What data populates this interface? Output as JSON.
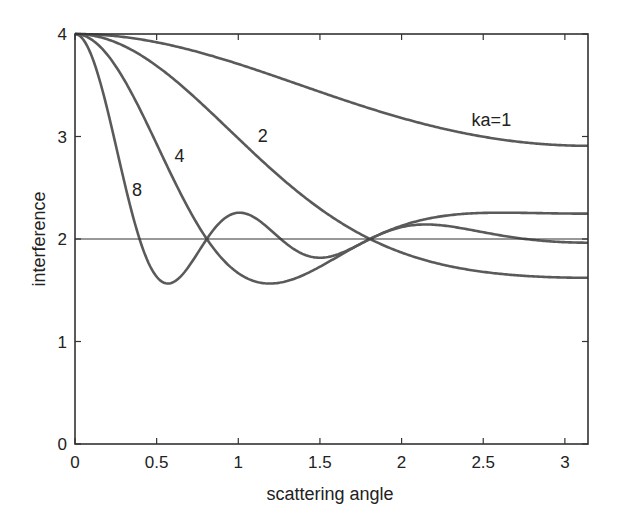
{
  "chart_data": {
    "type": "line",
    "title": "",
    "xlabel": "scattering angle",
    "ylabel": "interference",
    "xlim": [
      0,
      3.1416
    ],
    "ylim": [
      0,
      4
    ],
    "xticks": [
      0,
      0.5,
      1,
      1.5,
      2,
      2.5,
      3
    ],
    "xtick_labels": [
      "0",
      "0.5",
      "1",
      "1.5",
      "2",
      "2.5",
      "3"
    ],
    "yticks": [
      0,
      1,
      2,
      3,
      4
    ],
    "ytick_labels": [
      "0",
      "1",
      "2",
      "3",
      "4"
    ],
    "grid": false,
    "legend": "none (inline curve labels)",
    "reference_line": {
      "y": 2
    },
    "x": [
      0,
      0.1,
      0.2,
      0.3,
      0.4,
      0.5,
      0.6,
      0.7,
      0.8,
      0.9,
      1.0,
      1.1,
      1.2,
      1.3,
      1.4,
      1.5,
      1.6,
      1.7,
      1.8,
      1.9,
      2.0,
      2.1,
      2.2,
      2.3,
      2.4,
      2.5,
      2.6,
      2.7,
      2.8,
      2.9,
      3.0,
      3.1416
    ],
    "series": [
      {
        "name": "ka=1",
        "label": "ka=1",
        "ka": 1,
        "values": [
          4.0,
          4.0,
          3.99,
          3.97,
          3.95,
          3.92,
          3.88,
          3.84,
          3.79,
          3.75,
          3.71,
          3.65,
          3.6,
          3.55,
          3.49,
          3.44,
          3.39,
          3.33,
          3.28,
          3.23,
          3.18,
          3.14,
          3.1,
          3.06,
          3.02,
          3.0,
          2.97,
          2.95,
          2.93,
          2.92,
          2.91,
          2.91
        ]
      },
      {
        "name": "ka=2",
        "label": "2",
        "ka": 2,
        "values": [
          4.0,
          3.99,
          3.95,
          3.88,
          3.79,
          3.68,
          3.56,
          3.42,
          3.28,
          3.14,
          2.99,
          2.84,
          2.7,
          2.57,
          2.44,
          2.33,
          2.22,
          2.13,
          2.04,
          1.97,
          1.91,
          1.85,
          1.81,
          1.77,
          1.74,
          1.71,
          1.69,
          1.68,
          1.67,
          1.66,
          1.66,
          1.66
        ]
      },
      {
        "name": "ka=4",
        "label": "4",
        "ka": 4,
        "values": [
          4.0,
          3.95,
          3.79,
          3.56,
          3.28,
          2.99,
          2.7,
          2.44,
          2.22,
          2.04,
          1.91,
          1.82,
          1.77,
          1.76,
          1.77,
          1.81,
          1.86,
          1.92,
          1.98,
          2.04,
          2.09,
          2.13,
          2.16,
          2.18,
          2.2,
          2.21,
          2.21,
          2.21,
          2.21,
          2.21,
          2.21,
          2.21
        ]
      },
      {
        "name": "ka=8",
        "label": "8",
        "ka": 8,
        "values": [
          4.0,
          3.79,
          3.28,
          2.7,
          2.22,
          1.82,
          1.6,
          1.58,
          1.72,
          1.99,
          2.18,
          2.25,
          2.21,
          2.1,
          1.98,
          1.88,
          1.85,
          1.87,
          1.93,
          2.0,
          2.06,
          2.09,
          2.09,
          2.06,
          2.02,
          1.99,
          1.96,
          1.95,
          1.95,
          1.96,
          1.96,
          1.96
        ]
      }
    ],
    "annotations": [
      {
        "text": "ka=1",
        "x": 2.55,
        "y": 3.1
      },
      {
        "text": "2",
        "x": 1.15,
        "y": 2.95
      },
      {
        "text": "4",
        "x": 0.64,
        "y": 2.75
      },
      {
        "text": "8",
        "x": 0.38,
        "y": 2.42
      }
    ]
  }
}
